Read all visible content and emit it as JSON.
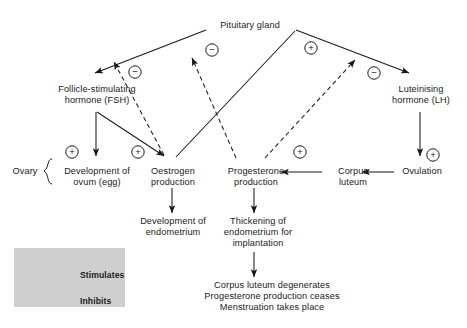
{
  "diagram": {
    "nodes": {
      "pituitary": "Pituitary gland",
      "fsh": "Follicle-stimulating\nhormone (FSH)",
      "lh": "Luteinising\nhormone (LH)",
      "ovary": "Ovary",
      "ovum": "Development of\novum (egg)",
      "oestrogen": "Oestrogen\nproduction",
      "progesterone": "Progesterone\nproduction",
      "corpus_luteum": "Corpus\nluteum",
      "ovulation": "Ovulation",
      "endometrium_dev": "Development of\nendometrium",
      "endometrium_thick": "Thickening of\nendometrium for\nimplantation",
      "outcome": "Corpus luteum degenerates\nProgesterone production ceases\nMenstruation takes place"
    },
    "signs": {
      "plus": "+",
      "minus": "−"
    },
    "sign_markers": [
      {
        "name": "minus-pituitary-fsh-inner",
        "sign": "−",
        "x": 212,
        "y": 50
      },
      {
        "name": "minus-fsh-branch",
        "sign": "−",
        "x": 135,
        "y": 72
      },
      {
        "name": "plus-pituitary-lh",
        "sign": "+",
        "x": 311,
        "y": 48
      },
      {
        "name": "minus-lh-branch",
        "sign": "−",
        "x": 374,
        "y": 73
      },
      {
        "name": "plus-ovum",
        "sign": "+",
        "x": 72,
        "y": 152
      },
      {
        "name": "plus-oestrogen",
        "sign": "+",
        "x": 138,
        "y": 152
      },
      {
        "name": "plus-progesterone",
        "sign": "+",
        "x": 300,
        "y": 152
      },
      {
        "name": "plus-ovulation",
        "sign": "+",
        "x": 433,
        "y": 155
      }
    ],
    "legend": {
      "stimulates": "Stimulates",
      "inhibits": "Inhibits",
      "stimulates_sign": "+",
      "inhibits_sign": "−"
    },
    "colors": {
      "stroke": "#1a1a1a",
      "legend_background": "#cfcfcf",
      "page_background": "#ffffff"
    }
  }
}
